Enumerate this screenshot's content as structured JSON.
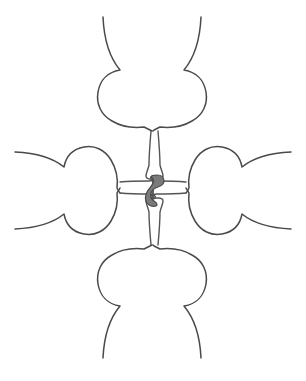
{
  "figure": {
    "canvas": {
      "width": 306,
      "height": 381,
      "background": "#ffffff"
    },
    "style": {
      "outline_color": "#4a4a4a",
      "outline_width": 1.5,
      "nucleus_fill": "#7a7a7a",
      "nucleus_stroke": "#4a4a4a"
    },
    "parts": [
      {
        "name": "top-lobe",
        "label": "Top lobe",
        "orientation": "up"
      },
      {
        "name": "bottom-lobe",
        "label": "Bottom lobe",
        "orientation": "down"
      },
      {
        "name": "left-lobe",
        "label": "Left lobe",
        "orientation": "left"
      },
      {
        "name": "right-lobe",
        "label": "Right lobe",
        "orientation": "right"
      },
      {
        "name": "top-stalk",
        "label": "Upper stalk",
        "orientation": "vertical"
      },
      {
        "name": "bottom-stalk",
        "label": "Lower stalk",
        "orientation": "vertical"
      },
      {
        "name": "left-stalk",
        "label": "Left stalk",
        "orientation": "horizontal"
      },
      {
        "name": "right-stalk",
        "label": "Right stalk",
        "orientation": "horizontal"
      },
      {
        "name": "central-nucleus",
        "label": "Central nucleus",
        "orientation": "center"
      }
    ],
    "geometry": {
      "center": {
        "x": 154,
        "y": 189
      },
      "top_lobe_extent_y": 16,
      "bottom_lobe_extent_y": 358,
      "left_lobe_extent_x": 14,
      "right_lobe_extent_x": 292
    },
    "paths": {
      "top_lobe": "M 103 17 C 104 40, 110 58, 120 70 C 108 72, 100 80, 98 92 C 96 104, 101 115, 112 121 C 122 127, 135 128, 144 127 C 146 128, 148 129, 150 130 L 152 131",
      "top_lobe_right": "M 201 17 C 200 40, 194 58, 184 70 C 196 72, 204 80, 206 92 C 208 104, 203 115, 192 121 C 182 127, 169 128, 160 127 C 158 128, 156 129, 154 130 L 153 131",
      "bottom_lobe": "M 103 358 C 104 336, 110 318, 120 306 C 108 304, 100 296, 98 284 C 96 272, 101 261, 112 255 C 122 249, 135 248, 144 249 C 146 248, 148 247, 150 246 L 152 245",
      "bottom_lobe_right": "M 201 358 C 200 336, 194 318, 184 306 C 196 304, 204 296, 206 284 C 208 272, 203 261, 192 255 C 182 249, 169 248, 160 249 C 158 248, 156 247, 154 246 L 153 245",
      "left_lobe_top": "M 15 152 C 36 153, 53 158, 64 167 C 66 156, 73 149, 84 147 C 95 145, 105 150, 111 160 C 117 170, 118 180, 117 188 C 118 190, 119 192, 120 193",
      "left_lobe_bottom": "M 15 229 C 36 228, 53 223, 64 214 C 66 225, 73 232, 84 234 C 95 236, 105 231, 111 221 C 117 211, 118 201, 117 193 C 118 191, 119 190, 120 188",
      "right_lobe_top": "M 291 152 C 270 153, 253 158, 242 167 C 240 156, 233 149, 222 147 C 211 145, 201 150, 195 160 C 189 170, 188 180, 189 188 C 188 190, 187 192, 186 193",
      "right_lobe_bottom": "M 291 229 C 270 228, 253 223, 242 214 C 240 225, 233 232, 222 234 C 211 236, 201 231, 195 221 C 189 211, 188 201, 189 193 C 188 191, 187 190, 186 188",
      "top_stalk": "M 151 131 C 150 143, 149 155, 149 165 C 148 170, 146 173, 146 176 C 146 178, 148 179, 151 179 L 158 179 C 161 179, 163 178, 163 176 C 163 173, 161 170, 160 165 C 160 155, 159 143, 158 131",
      "bottom_stalk": "M 151 245 C 150 234, 149 222, 149 212 C 148 207, 146 204, 146 201 C 146 199, 148 198, 151 198 L 158 198 C 161 198, 163 199, 163 201 C 163 204, 161 207, 160 212 C 160 222, 159 234, 158 245",
      "left_stalk": "M 120 182 C 131 181, 142 181, 149 181 C 152 181, 154 180, 155 179 C 156 178, 155 176, 153 176 L 153 199 C 155 199, 156 197, 155 196 C 154 195, 152 194, 149 194 C 142 194, 131 194, 120 193",
      "right_stalk": "M 186 182 C 175 181, 164 181, 157 181 C 154 181, 152 180, 151 179 C 150 178, 151 176, 153 176 L 153 199 C 151 199, 150 197, 151 196 C 152 195, 154 194, 157 194 C 164 194, 175 194, 186 193",
      "nucleus": "M 157 175 C 161 175, 164 177, 164 181 C 164 184, 161 186, 158 187 C 155 188, 152 190, 151 193 C 150 196, 151 199, 154 201 C 157 203, 158 205, 156 206 C 153 207, 149 206, 147 203 C 145 200, 145 196, 147 192 C 149 188, 152 186, 153 183 C 154 180, 153 178, 151 177 C 152 175, 154 175, 157 175 Z"
    }
  }
}
